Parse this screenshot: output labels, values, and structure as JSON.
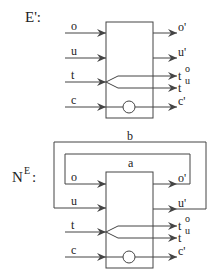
{
  "diagrams": [
    {
      "id": "E_prime",
      "title": "E':",
      "inputs": [
        "o",
        "u",
        "t",
        "c"
      ],
      "outputs": [
        "o'",
        "u'",
        "t",
        "t",
        "c'"
      ],
      "output_superscripts": {
        "t_top": "o",
        "t_bottom": "u"
      }
    },
    {
      "id": "N_E",
      "title_base": "N",
      "title_sup": "E",
      "title_suffix": ":",
      "inputs": [
        "o",
        "u",
        "t",
        "c"
      ],
      "outputs": [
        "o'",
        "u'",
        "t",
        "t",
        "c'"
      ],
      "output_superscripts": {
        "t_top": "o",
        "t_bottom": "u"
      },
      "loops": [
        {
          "label": "a",
          "from": "o'",
          "to": "o"
        },
        {
          "label": "b",
          "from": "u'",
          "to": "u"
        }
      ]
    }
  ],
  "colors": {
    "line": "#444444",
    "text": "#222222",
    "background": "#ffffff"
  }
}
